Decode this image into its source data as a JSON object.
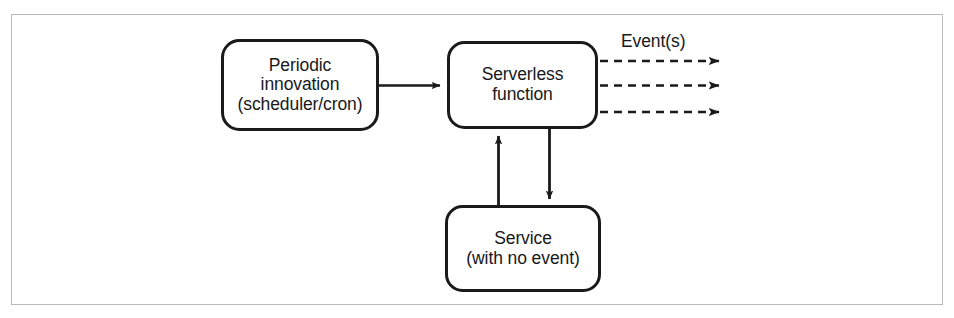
{
  "figure": {
    "background_color": "#ffffff",
    "frame_color": "#b9b9b9",
    "stroke_color": "#1a1a1a"
  },
  "diagram": {
    "type": "flow-diagram",
    "nodes": [
      {
        "id": "periodic-innovation",
        "shape": "rounded-rectangle",
        "lines": [
          "Periodic",
          "innovation",
          "(scheduler/cron)"
        ],
        "x": 222,
        "y": 40,
        "width": 156,
        "height": 90
      },
      {
        "id": "serverless-function",
        "shape": "rounded-rectangle",
        "lines": [
          "Serverless",
          "function"
        ],
        "x": 448,
        "y": 42,
        "width": 149,
        "height": 86
      },
      {
        "id": "service-with-no-event",
        "shape": "rounded-rectangle",
        "lines": [
          "Service",
          "(with no event)"
        ],
        "x": 446,
        "y": 206,
        "width": 154,
        "height": 85
      }
    ],
    "edges": [
      {
        "id": "periodic-to-serverless",
        "from": "periodic-innovation",
        "to": "serverless-function",
        "style": "solid",
        "direction": "right"
      },
      {
        "id": "service-to-serverless",
        "from": "service-with-no-event",
        "to": "serverless-function",
        "style": "solid",
        "direction": "up"
      },
      {
        "id": "serverless-to-service",
        "from": "serverless-function",
        "to": "service-with-no-event",
        "style": "solid",
        "direction": "down"
      },
      {
        "id": "serverless-event-out-1",
        "from": "serverless-function",
        "to": "",
        "style": "dashed",
        "direction": "right",
        "label": "Event(s)"
      },
      {
        "id": "serverless-event-out-2",
        "from": "serverless-function",
        "to": "",
        "style": "dashed",
        "direction": "right",
        "label": ""
      },
      {
        "id": "serverless-event-out-3",
        "from": "serverless-function",
        "to": "",
        "style": "dashed",
        "direction": "right",
        "label": ""
      }
    ],
    "labels": {
      "events": "Event(s)"
    }
  }
}
